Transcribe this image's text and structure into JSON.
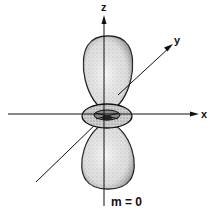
{
  "figure": {
    "type": "orbital-diagram",
    "axes": {
      "z_label": "z",
      "y_label": "y",
      "x_label": "x"
    },
    "caption": "m = 0",
    "colors": {
      "ink": "#111111",
      "lobe_fill": "#d9d9d9",
      "torus_fill": "#bdbdbd",
      "background": "#ffffff"
    }
  }
}
